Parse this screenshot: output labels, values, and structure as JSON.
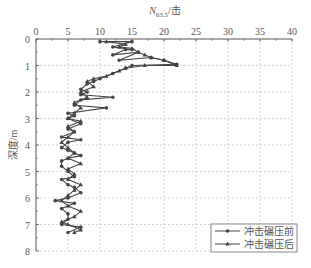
{
  "chart_data": {
    "type": "line",
    "title": "",
    "xlabel": "N63.5/击",
    "xlabel_main": "N",
    "xlabel_sub": "63.5",
    "xlabel_suffix": "/击",
    "ylabel": "深度/m",
    "xlim": [
      0,
      40
    ],
    "ylim": [
      0,
      8
    ],
    "y_inverted": true,
    "x_axis_position": "top",
    "xticks": [
      0,
      5,
      10,
      15,
      20,
      25,
      30,
      35,
      40
    ],
    "yticks": [
      0,
      1,
      2,
      3,
      4,
      5,
      6,
      7,
      8
    ],
    "grid": true,
    "legend_position": "lower right",
    "series": [
      {
        "name": "冲击碾压前",
        "marker": "circle",
        "points": [
          [
            10,
            0.1
          ],
          [
            15,
            0.1
          ],
          [
            12,
            0.3
          ],
          [
            15,
            0.4
          ],
          [
            14,
            0.4
          ],
          [
            12,
            0.6
          ],
          [
            16,
            0.5
          ],
          [
            13,
            0.8
          ],
          [
            18,
            0.7
          ],
          [
            20,
            0.8
          ],
          [
            22,
            0.95
          ],
          [
            15,
            1.0
          ],
          [
            14,
            1.1
          ],
          [
            12,
            1.3
          ],
          [
            10,
            1.5
          ],
          [
            9,
            1.6
          ],
          [
            8,
            1.7
          ],
          [
            7,
            1.9
          ],
          [
            8,
            2.0
          ],
          [
            7,
            2.1
          ],
          [
            12,
            2.2
          ],
          [
            7,
            2.3
          ],
          [
            6,
            2.5
          ],
          [
            11,
            2.6
          ],
          [
            5,
            2.8
          ],
          [
            6,
            2.9
          ],
          [
            5,
            3.0
          ],
          [
            7,
            3.2
          ],
          [
            5,
            3.4
          ],
          [
            6,
            3.5
          ],
          [
            4,
            3.7
          ],
          [
            7,
            3.8
          ],
          [
            5,
            3.9
          ],
          [
            4,
            4.1
          ],
          [
            5,
            4.2
          ],
          [
            6,
            4.3
          ],
          [
            7,
            4.4
          ],
          [
            5,
            4.5
          ],
          [
            4,
            4.6
          ],
          [
            4,
            4.8
          ],
          [
            5,
            5.0
          ],
          [
            6,
            5.2
          ],
          [
            4,
            5.3
          ],
          [
            5,
            5.5
          ],
          [
            6,
            5.6
          ],
          [
            7,
            5.8
          ],
          [
            5,
            6.0
          ],
          [
            3,
            6.1
          ],
          [
            6,
            6.2
          ],
          [
            4,
            6.4
          ],
          [
            5,
            6.6
          ],
          [
            5,
            6.8
          ],
          [
            4,
            7.0
          ],
          [
            7,
            7.1
          ],
          [
            5,
            7.3
          ]
        ]
      },
      {
        "name": "冲击碾压后",
        "marker": "triangle",
        "points": [
          [
            11,
            0.1
          ],
          [
            14,
            0.2
          ],
          [
            13,
            0.3
          ],
          [
            15,
            0.35
          ],
          [
            16,
            0.5
          ],
          [
            17,
            0.6
          ],
          [
            18,
            0.7
          ],
          [
            20,
            0.8
          ],
          [
            22,
            1.0
          ],
          [
            17,
            1.0
          ],
          [
            14,
            1.1
          ],
          [
            13,
            1.2
          ],
          [
            11,
            1.4
          ],
          [
            9,
            1.5
          ],
          [
            8,
            1.6
          ],
          [
            9,
            1.8
          ],
          [
            7,
            2.0
          ],
          [
            8,
            2.2
          ],
          [
            6,
            2.4
          ],
          [
            7,
            2.6
          ],
          [
            6,
            2.8
          ],
          [
            5,
            3.0
          ],
          [
            7,
            3.1
          ],
          [
            5,
            3.3
          ],
          [
            6,
            3.5
          ],
          [
            5,
            3.7
          ],
          [
            4,
            3.9
          ],
          [
            5,
            4.1
          ],
          [
            6,
            4.3
          ],
          [
            5,
            4.5
          ],
          [
            7,
            4.7
          ],
          [
            5,
            4.9
          ],
          [
            6,
            5.1
          ],
          [
            5,
            5.3
          ],
          [
            7,
            5.5
          ],
          [
            6,
            5.7
          ],
          [
            5,
            5.9
          ],
          [
            4,
            6.1
          ],
          [
            5,
            6.3
          ],
          [
            7,
            6.5
          ],
          [
            6,
            6.7
          ],
          [
            4,
            6.9
          ],
          [
            5,
            7.0
          ],
          [
            7,
            7.2
          ],
          [
            6,
            7.3
          ]
        ]
      }
    ]
  },
  "legend": {
    "items": [
      {
        "label": "冲击碾压前",
        "marker": "circle"
      },
      {
        "label": "冲击碾压后",
        "marker": "triangle"
      }
    ]
  },
  "axis": {
    "x_title_main": "N",
    "x_title_sub": "63.5",
    "x_title_suffix": "/击",
    "y_title": "深度/m"
  },
  "colors": {
    "line": "#444444",
    "grid": "#bbbbbb",
    "axis": "#555555",
    "text": "#555555"
  }
}
